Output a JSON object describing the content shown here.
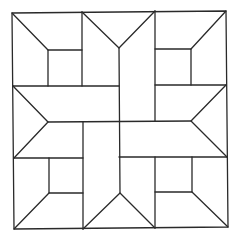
{
  "diagram": {
    "stroke_color": "#2a2a2a",
    "background": "#ffffff",
    "outer_square": {
      "tl": [
        12,
        13
      ],
      "tr": [
        226,
        11
      ],
      "br": [
        228,
        227
      ],
      "bl": [
        14,
        229
      ]
    },
    "corner_blocks": [
      {
        "name": "top-left",
        "inner_square": [
          [
            48,
            50
          ],
          [
            82,
            50
          ],
          [
            82,
            86
          ],
          [
            48,
            86
          ]
        ],
        "diagonal": [
          [
            12,
            13
          ],
          [
            48,
            50
          ]
        ]
      },
      {
        "name": "top-right",
        "inner_square": [
          [
            155,
            49
          ],
          [
            191,
            49
          ],
          [
            191,
            85
          ],
          [
            155,
            85
          ]
        ],
        "diagonal": [
          [
            226,
            11
          ],
          [
            191,
            49
          ]
        ]
      },
      {
        "name": "bottom-left",
        "inner_square": [
          [
            49,
            158
          ],
          [
            83,
            158
          ],
          [
            83,
            193
          ],
          [
            49,
            193
          ]
        ],
        "diagonal": [
          [
            14,
            229
          ],
          [
            49,
            193
          ]
        ]
      },
      {
        "name": "bottom-right",
        "inner_square": [
          [
            155,
            157
          ],
          [
            192,
            157
          ],
          [
            192,
            192
          ],
          [
            155,
            192
          ]
        ],
        "diagonal": [
          [
            228,
            227
          ],
          [
            192,
            192
          ]
        ]
      }
    ],
    "arrow_pieces": [
      {
        "name": "top",
        "points": [
          [
            82,
            12
          ],
          [
            119,
            48
          ],
          [
            155,
            11
          ]
        ]
      },
      {
        "name": "left",
        "points": [
          [
            13,
            86
          ],
          [
            48,
            122
          ],
          [
            14,
            158
          ]
        ]
      },
      {
        "name": "right",
        "points": [
          [
            226,
            85
          ],
          [
            191,
            121
          ],
          [
            227,
            157
          ]
        ]
      },
      {
        "name": "bottom",
        "points": [
          [
            83,
            229
          ],
          [
            120,
            193
          ],
          [
            155,
            228
          ]
        ]
      }
    ]
  }
}
